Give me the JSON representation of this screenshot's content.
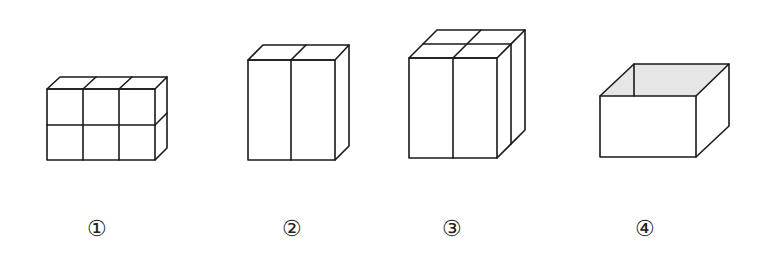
{
  "figures": [
    {
      "id": "1",
      "label": "①",
      "description": "2x3 arrangement of six small cubes (2 rows, 3 columns, 1 deep)",
      "label_x": 97
    },
    {
      "id": "2",
      "label": "②",
      "description": "two tall rectangular prisms side by side",
      "label_x": 292
    },
    {
      "id": "3",
      "label": "③",
      "description": "four tall rectangular prisms arranged 2x2",
      "label_x": 452
    },
    {
      "id": "4",
      "label": "④",
      "description": "open-top rectangular box with shaded interior",
      "label_x": 645
    }
  ],
  "colors": {
    "line": "#1a1a1a",
    "shade": "#e6e6e6",
    "background": "#ffffff"
  }
}
